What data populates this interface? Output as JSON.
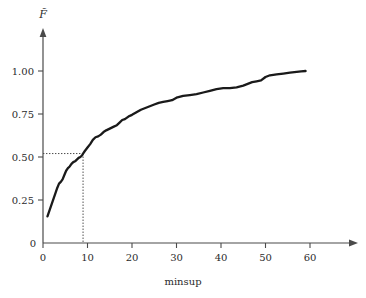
{
  "chart_data": {
    "type": "line",
    "title": "",
    "xlabel": "minsup",
    "ylabel": "F̃",
    "ylabel_plain": "F-tilde",
    "xlim": [
      0,
      67
    ],
    "ylim": [
      0,
      1.12
    ],
    "grid": false,
    "legend": null,
    "xticks": [
      0,
      10,
      20,
      30,
      40,
      50,
      60
    ],
    "xtick_labels": [
      "0",
      "10",
      "20",
      "30",
      "40",
      "50",
      "60"
    ],
    "yticks": [
      0,
      0.25,
      0.5,
      0.75,
      1.0
    ],
    "ytick_labels": [
      "0",
      "0.25",
      "0.50",
      "0.75",
      "1.00"
    ],
    "origin_label": "0",
    "series": [
      {
        "name": "empirical CDF",
        "color": "#1a1a1a",
        "x": [
          1.0,
          1.6,
          2.2,
          2.8,
          3.2,
          3.6,
          4.0,
          4.4,
          4.8,
          5.2,
          5.6,
          6.0,
          6.4,
          6.8,
          7.2,
          7.6,
          8.0,
          8.4,
          8.8,
          9.0,
          9.4,
          10.0,
          10.6,
          11.2,
          11.8,
          12.4,
          13.0,
          13.6,
          14.2,
          15.0,
          15.8,
          16.6,
          17.2,
          17.8,
          18.4,
          19.2,
          20.0,
          21.0,
          22.0,
          23.0,
          24.0,
          25.0,
          26.0,
          27.0,
          28.0,
          29.0,
          30.0,
          31.5,
          33.0,
          34.5,
          36.0,
          37.5,
          39.0,
          40.5,
          42.0,
          43.5,
          45.0,
          46.0,
          47.0,
          48.0,
          49.0,
          50.0,
          51.0,
          52.5,
          54.0,
          55.5,
          57.0,
          58.0,
          59.0
        ],
        "y": [
          0.155,
          0.2,
          0.245,
          0.29,
          0.32,
          0.345,
          0.355,
          0.37,
          0.395,
          0.42,
          0.435,
          0.445,
          0.46,
          0.47,
          0.475,
          0.485,
          0.495,
          0.5,
          0.51,
          0.52,
          0.535,
          0.555,
          0.575,
          0.6,
          0.615,
          0.62,
          0.63,
          0.645,
          0.655,
          0.665,
          0.675,
          0.685,
          0.7,
          0.715,
          0.72,
          0.735,
          0.745,
          0.76,
          0.775,
          0.785,
          0.795,
          0.805,
          0.815,
          0.82,
          0.825,
          0.83,
          0.845,
          0.855,
          0.86,
          0.865,
          0.875,
          0.885,
          0.895,
          0.9,
          0.9,
          0.905,
          0.915,
          0.925,
          0.935,
          0.94,
          0.945,
          0.965,
          0.975,
          0.98,
          0.985,
          0.99,
          0.995,
          0.998,
          1.0
        ]
      }
    ],
    "annotations": [
      {
        "type": "guideline",
        "name": "median-guideline",
        "x": 9.0,
        "y": 0.52,
        "style": "dotted"
      }
    ]
  }
}
